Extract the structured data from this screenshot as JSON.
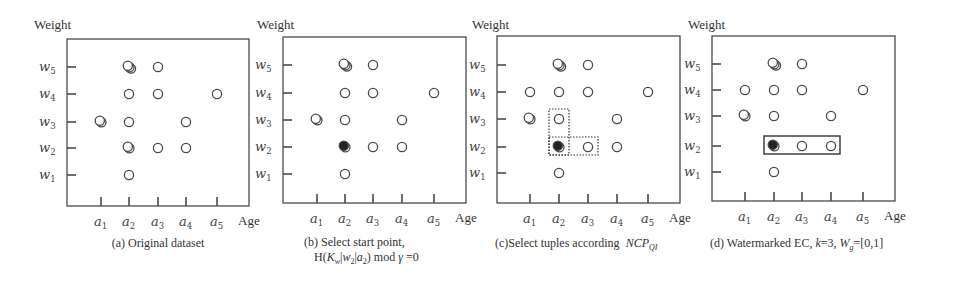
{
  "figure": {
    "y_axis_title": "Weight",
    "x_axis_title": "Age",
    "y_ticks": [
      {
        "base": "w",
        "sub": "1"
      },
      {
        "base": "w",
        "sub": "2"
      },
      {
        "base": "w",
        "sub": "3"
      },
      {
        "base": "w",
        "sub": "4"
      },
      {
        "base": "w",
        "sub": "5"
      }
    ],
    "x_ticks": [
      {
        "base": "a",
        "sub": "1"
      },
      {
        "base": "a",
        "sub": "2"
      },
      {
        "base": "a",
        "sub": "3"
      },
      {
        "base": "a",
        "sub": "4"
      },
      {
        "base": "a",
        "sub": "5"
      }
    ]
  },
  "panels": [
    {
      "id": "a",
      "caption_line1": "(a) Original dataset",
      "caption_line2": "",
      "points": [
        {
          "age": 2,
          "weight": 5,
          "count": 3,
          "filled": false
        },
        {
          "age": 3,
          "weight": 5,
          "count": 1,
          "filled": false
        },
        {
          "age": 2,
          "weight": 4,
          "count": 1,
          "filled": false
        },
        {
          "age": 3,
          "weight": 4,
          "count": 1,
          "filled": false
        },
        {
          "age": 5,
          "weight": 4,
          "count": 1,
          "filled": false
        },
        {
          "age": 1,
          "weight": 3,
          "count": 2,
          "filled": false
        },
        {
          "age": 2,
          "weight": 3,
          "count": 1,
          "filled": false
        },
        {
          "age": 4,
          "weight": 3,
          "count": 1,
          "filled": false
        },
        {
          "age": 2,
          "weight": 2,
          "count": 2,
          "filled": false
        },
        {
          "age": 3,
          "weight": 2,
          "count": 1,
          "filled": false
        },
        {
          "age": 4,
          "weight": 2,
          "count": 1,
          "filled": false
        },
        {
          "age": 2,
          "weight": 1,
          "count": 1,
          "filled": false
        }
      ],
      "boxes": []
    },
    {
      "id": "b",
      "caption_line1": "(b)  Select start point,",
      "caption_line2": "H(K_w|w_2|a_2) mod γ =0",
      "points": [
        {
          "age": 2,
          "weight": 5,
          "count": 3,
          "filled": false
        },
        {
          "age": 3,
          "weight": 5,
          "count": 1,
          "filled": false
        },
        {
          "age": 2,
          "weight": 4,
          "count": 1,
          "filled": false
        },
        {
          "age": 3,
          "weight": 4,
          "count": 1,
          "filled": false
        },
        {
          "age": 5,
          "weight": 4,
          "count": 1,
          "filled": false
        },
        {
          "age": 1,
          "weight": 3,
          "count": 2,
          "filled": false
        },
        {
          "age": 2,
          "weight": 3,
          "count": 1,
          "filled": false
        },
        {
          "age": 4,
          "weight": 3,
          "count": 1,
          "filled": false
        },
        {
          "age": 2,
          "weight": 2,
          "count": 2,
          "filled": true
        },
        {
          "age": 3,
          "weight": 2,
          "count": 1,
          "filled": false
        },
        {
          "age": 4,
          "weight": 2,
          "count": 1,
          "filled": false
        },
        {
          "age": 2,
          "weight": 1,
          "count": 1,
          "filled": false
        }
      ],
      "boxes": []
    },
    {
      "id": "c",
      "caption_line1": "(c)Select tuples according  NCP_QI",
      "caption_line2": "",
      "points": [
        {
          "age": 2,
          "weight": 5,
          "count": 3,
          "filled": false
        },
        {
          "age": 3,
          "weight": 5,
          "count": 1,
          "filled": false
        },
        {
          "age": 1,
          "weight": 4,
          "count": 1,
          "filled": false
        },
        {
          "age": 2,
          "weight": 4,
          "count": 1,
          "filled": false
        },
        {
          "age": 3,
          "weight": 4,
          "count": 1,
          "filled": false
        },
        {
          "age": 5,
          "weight": 4,
          "count": 1,
          "filled": false
        },
        {
          "age": 1,
          "weight": 3,
          "count": 2,
          "filled": false
        },
        {
          "age": 2,
          "weight": 3,
          "count": 1,
          "filled": false
        },
        {
          "age": 4,
          "weight": 3,
          "count": 1,
          "filled": false
        },
        {
          "age": 2,
          "weight": 2,
          "count": 2,
          "filled": true
        },
        {
          "age": 3,
          "weight": 2,
          "count": 1,
          "filled": false
        },
        {
          "age": 4,
          "weight": 2,
          "count": 1,
          "filled": false
        },
        {
          "age": 2,
          "weight": 1,
          "count": 1,
          "filled": false
        }
      ],
      "boxes": [
        {
          "style": "dotted",
          "age_from": 2,
          "age_to": 2,
          "weight_from": 2,
          "weight_to": 3
        },
        {
          "style": "dotted",
          "age_from": 2,
          "age_to": 3,
          "weight_from": 2,
          "weight_to": 2
        }
      ]
    },
    {
      "id": "d",
      "caption_line1": "(d) Watermarked EC, k=3, W_g=[0,1]",
      "caption_line2": "",
      "points": [
        {
          "age": 2,
          "weight": 5,
          "count": 3,
          "filled": false
        },
        {
          "age": 3,
          "weight": 5,
          "count": 1,
          "filled": false
        },
        {
          "age": 1,
          "weight": 4,
          "count": 1,
          "filled": false
        },
        {
          "age": 2,
          "weight": 4,
          "count": 1,
          "filled": false
        },
        {
          "age": 3,
          "weight": 4,
          "count": 1,
          "filled": false
        },
        {
          "age": 5,
          "weight": 4,
          "count": 1,
          "filled": false
        },
        {
          "age": 1,
          "weight": 3,
          "count": 2,
          "filled": false
        },
        {
          "age": 2,
          "weight": 3,
          "count": 1,
          "filled": false
        },
        {
          "age": 4,
          "weight": 3,
          "count": 1,
          "filled": false
        },
        {
          "age": 2,
          "weight": 2,
          "count": 2,
          "filled": true
        },
        {
          "age": 3,
          "weight": 2,
          "count": 1,
          "filled": false
        },
        {
          "age": 4,
          "weight": 2,
          "count": 1,
          "filled": false
        },
        {
          "age": 2,
          "weight": 1,
          "count": 1,
          "filled": false
        }
      ],
      "boxes": [
        {
          "style": "solid",
          "age_from": 2,
          "age_to": 4,
          "weight_from": 2,
          "weight_to": 2
        }
      ]
    }
  ]
}
